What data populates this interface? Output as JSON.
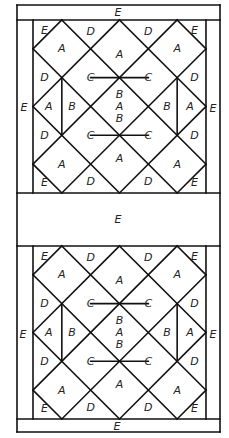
{
  "diagram": {
    "colors": {
      "line": "#111111",
      "background": "#ffffff",
      "label": "#222222"
    },
    "frame": {
      "outer_left": 17,
      "outer_right": 220,
      "top": 5,
      "bottom": 432
    },
    "unit": 28.83,
    "blocks": [
      {
        "name": "upper-block",
        "x": 33,
        "y": 20
      },
      {
        "name": "lower-block",
        "x": 33,
        "y": 246
      }
    ],
    "border_labels": {
      "top": "E",
      "middle": "E",
      "bottom": "E",
      "upper_left": "E",
      "upper_right": "E",
      "lower_left": "E",
      "lower_right": "E"
    },
    "block_labels": [
      {
        "text": "E",
        "u": 0.4,
        "v": 0.35
      },
      {
        "text": "A",
        "u": 1.0,
        "v": 1.0
      },
      {
        "text": "D",
        "u": 2.0,
        "v": 0.4
      },
      {
        "text": "A",
        "u": 3.0,
        "v": 1.2
      },
      {
        "text": "D",
        "u": 4.0,
        "v": 0.4
      },
      {
        "text": "A",
        "u": 5.0,
        "v": 1.0
      },
      {
        "text": "E",
        "u": 5.6,
        "v": 0.35
      },
      {
        "text": "B",
        "u": 3.0,
        "v": 2.6
      },
      {
        "text": "D",
        "u": 0.4,
        "v": 2.0
      },
      {
        "text": "C",
        "u": 2.0,
        "v": 2.0
      },
      {
        "text": "C",
        "u": 4.0,
        "v": 2.0
      },
      {
        "text": "D",
        "u": 5.6,
        "v": 2.0
      },
      {
        "text": "A",
        "u": 0.55,
        "v": 3.0
      },
      {
        "text": "B",
        "u": 1.35,
        "v": 3.0
      },
      {
        "text": "A",
        "u": 3.0,
        "v": 3.0
      },
      {
        "text": "B",
        "u": 4.65,
        "v": 3.0
      },
      {
        "text": "A",
        "u": 5.45,
        "v": 3.0
      },
      {
        "text": "D",
        "u": 0.4,
        "v": 4.0
      },
      {
        "text": "C",
        "u": 2.0,
        "v": 4.0
      },
      {
        "text": "C",
        "u": 4.0,
        "v": 4.0
      },
      {
        "text": "D",
        "u": 5.6,
        "v": 4.0
      },
      {
        "text": "B",
        "u": 3.0,
        "v": 3.4
      },
      {
        "text": "A",
        "u": 1.0,
        "v": 5.0
      },
      {
        "text": "A",
        "u": 3.0,
        "v": 4.8
      },
      {
        "text": "A",
        "u": 5.0,
        "v": 5.0
      },
      {
        "text": "E",
        "u": 0.4,
        "v": 5.65
      },
      {
        "text": "D",
        "u": 2.0,
        "v": 5.6
      },
      {
        "text": "D",
        "u": 4.0,
        "v": 5.6
      },
      {
        "text": "E",
        "u": 5.6,
        "v": 5.65
      }
    ]
  }
}
